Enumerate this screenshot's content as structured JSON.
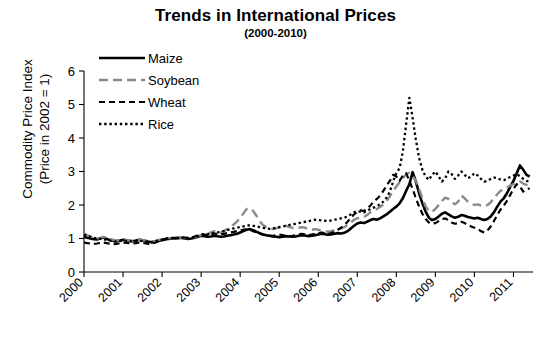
{
  "chart_data": {
    "type": "line",
    "title": "Trends in International Prices",
    "subtitle": "(2000-2010)",
    "xlabel": "",
    "ylabel_line1": "Commodity Price Index",
    "ylabel_line2": "(Price in 2002 = 1)",
    "ylim": [
      0,
      6
    ],
    "yticks": [
      0,
      1,
      2,
      3,
      4,
      5,
      6
    ],
    "xlim": [
      2000,
      2011.5
    ],
    "xticks": [
      2000,
      2001,
      2002,
      2003,
      2004,
      2005,
      2006,
      2007,
      2008,
      2009,
      2010,
      2011
    ],
    "xtick_labels": [
      "2000",
      "2001",
      "2002",
      "2003",
      "2004",
      "2005",
      "2006",
      "2007",
      "2008",
      "2009",
      "2010",
      "2011"
    ],
    "xtick_rotation_deg": -45,
    "grid": false,
    "legend_position": "top-left-inside",
    "x_start": 2000.0,
    "x_step": 0.0833333,
    "series": [
      {
        "name": "Maize",
        "color": "#000000",
        "style": "solid",
        "width": 2.6,
        "values": [
          1.05,
          1.02,
          1.0,
          0.98,
          0.97,
          1.0,
          1.03,
          0.99,
          0.95,
          0.93,
          0.92,
          0.94,
          0.96,
          0.95,
          0.93,
          0.92,
          0.94,
          0.96,
          0.95,
          0.92,
          0.9,
          0.88,
          0.9,
          0.93,
          0.95,
          0.97,
          0.99,
          1.0,
          1.0,
          1.01,
          1.02,
          1.0,
          0.99,
          1.0,
          1.02,
          1.05,
          1.08,
          1.07,
          1.05,
          1.06,
          1.08,
          1.07,
          1.05,
          1.06,
          1.08,
          1.1,
          1.12,
          1.14,
          1.18,
          1.22,
          1.26,
          1.28,
          1.25,
          1.2,
          1.16,
          1.12,
          1.1,
          1.08,
          1.06,
          1.05,
          1.04,
          1.05,
          1.07,
          1.06,
          1.05,
          1.06,
          1.08,
          1.1,
          1.09,
          1.07,
          1.08,
          1.1,
          1.12,
          1.14,
          1.13,
          1.11,
          1.12,
          1.14,
          1.16,
          1.15,
          1.17,
          1.22,
          1.3,
          1.38,
          1.45,
          1.48,
          1.46,
          1.5,
          1.55,
          1.58,
          1.56,
          1.6,
          1.66,
          1.72,
          1.8,
          1.88,
          1.95,
          2.05,
          2.2,
          2.42,
          2.62,
          2.98,
          2.7,
          2.35,
          2.05,
          1.8,
          1.62,
          1.55,
          1.58,
          1.66,
          1.74,
          1.78,
          1.72,
          1.66,
          1.62,
          1.65,
          1.7,
          1.68,
          1.64,
          1.62,
          1.6,
          1.62,
          1.58,
          1.55,
          1.58,
          1.66,
          1.78,
          1.95,
          2.1,
          2.2,
          2.35,
          2.55,
          2.72,
          2.95,
          3.18,
          3.05,
          2.9,
          2.85
        ]
      },
      {
        "name": "Soybean",
        "color": "#8a8a8a",
        "style": "dash-long",
        "width": 2.4,
        "values": [
          1.14,
          1.1,
          1.06,
          1.02,
          1.0,
          1.02,
          1.05,
          1.03,
          0.99,
          0.96,
          0.94,
          0.95,
          0.97,
          0.96,
          0.94,
          0.93,
          0.95,
          0.97,
          0.96,
          0.94,
          0.92,
          0.91,
          0.93,
          0.96,
          0.98,
          1.0,
          1.01,
          1.02,
          1.01,
          1.02,
          1.03,
          1.02,
          1.01,
          1.02,
          1.04,
          1.07,
          1.1,
          1.12,
          1.14,
          1.18,
          1.22,
          1.2,
          1.18,
          1.22,
          1.28,
          1.35,
          1.42,
          1.5,
          1.62,
          1.75,
          1.88,
          1.9,
          1.82,
          1.68,
          1.52,
          1.4,
          1.34,
          1.3,
          1.28,
          1.3,
          1.33,
          1.36,
          1.38,
          1.35,
          1.32,
          1.3,
          1.32,
          1.34,
          1.32,
          1.28,
          1.26,
          1.28,
          1.26,
          1.24,
          1.22,
          1.2,
          1.22,
          1.25,
          1.28,
          1.3,
          1.34,
          1.4,
          1.48,
          1.56,
          1.6,
          1.62,
          1.64,
          1.7,
          1.78,
          1.84,
          1.88,
          1.94,
          2.02,
          2.12,
          2.26,
          2.42,
          2.55,
          2.68,
          2.8,
          2.92,
          2.96,
          2.88,
          2.72,
          2.48,
          2.2,
          1.96,
          1.82,
          1.8,
          1.88,
          2.0,
          2.12,
          2.22,
          2.18,
          2.08,
          2.02,
          2.1,
          2.28,
          2.2,
          2.1,
          2.04,
          2.0,
          2.02,
          1.98,
          1.96,
          2.0,
          2.08,
          2.2,
          2.32,
          2.42,
          2.48,
          2.52,
          2.58,
          2.62,
          2.66,
          2.7,
          2.64,
          2.6,
          2.58
        ]
      },
      {
        "name": "Wheat",
        "color": "#000000",
        "style": "dash",
        "width": 2.2,
        "values": [
          0.88,
          0.86,
          0.85,
          0.84,
          0.85,
          0.87,
          0.88,
          0.86,
          0.84,
          0.83,
          0.84,
          0.86,
          0.88,
          0.87,
          0.86,
          0.85,
          0.86,
          0.88,
          0.87,
          0.85,
          0.84,
          0.85,
          0.88,
          0.92,
          0.96,
          0.99,
          1.01,
          1.02,
          1.02,
          1.03,
          1.04,
          1.03,
          1.02,
          1.03,
          1.06,
          1.1,
          1.14,
          1.12,
          1.1,
          1.12,
          1.15,
          1.14,
          1.12,
          1.14,
          1.16,
          1.18,
          1.2,
          1.22,
          1.24,
          1.26,
          1.28,
          1.26,
          1.22,
          1.18,
          1.14,
          1.12,
          1.1,
          1.09,
          1.08,
          1.1,
          1.12,
          1.1,
          1.08,
          1.07,
          1.08,
          1.1,
          1.12,
          1.14,
          1.12,
          1.1,
          1.12,
          1.14,
          1.16,
          1.18,
          1.16,
          1.14,
          1.16,
          1.2,
          1.26,
          1.32,
          1.4,
          1.5,
          1.62,
          1.72,
          1.8,
          1.84,
          1.82,
          1.88,
          1.98,
          2.1,
          2.18,
          2.28,
          2.42,
          2.58,
          2.72,
          2.9,
          2.85,
          2.72,
          2.88,
          2.95,
          2.72,
          2.48,
          2.2,
          1.95,
          1.74,
          1.58,
          1.48,
          1.44,
          1.46,
          1.52,
          1.58,
          1.6,
          1.55,
          1.48,
          1.44,
          1.46,
          1.5,
          1.46,
          1.4,
          1.36,
          1.32,
          1.28,
          1.22,
          1.18,
          1.24,
          1.36,
          1.52,
          1.7,
          1.86,
          1.98,
          2.12,
          2.3,
          2.48,
          2.62,
          2.55,
          2.4,
          2.46,
          2.5
        ]
      },
      {
        "name": "Rice",
        "color": "#000000",
        "style": "dot",
        "width": 2.3,
        "values": [
          1.12,
          1.08,
          1.05,
          1.02,
          1.0,
          0.99,
          0.98,
          0.96,
          0.94,
          0.92,
          0.91,
          0.92,
          0.94,
          0.93,
          0.92,
          0.91,
          0.92,
          0.93,
          0.92,
          0.91,
          0.9,
          0.9,
          0.92,
          0.95,
          0.97,
          0.99,
          1.0,
          1.01,
          1.01,
          1.02,
          1.02,
          1.01,
          1.01,
          1.02,
          1.04,
          1.06,
          1.08,
          1.1,
          1.12,
          1.14,
          1.16,
          1.18,
          1.2,
          1.22,
          1.25,
          1.28,
          1.3,
          1.32,
          1.34,
          1.36,
          1.38,
          1.4,
          1.38,
          1.36,
          1.34,
          1.32,
          1.3,
          1.29,
          1.3,
          1.32,
          1.34,
          1.36,
          1.38,
          1.4,
          1.42,
          1.44,
          1.46,
          1.48,
          1.5,
          1.52,
          1.54,
          1.56,
          1.55,
          1.54,
          1.53,
          1.52,
          1.54,
          1.56,
          1.58,
          1.6,
          1.62,
          1.66,
          1.72,
          1.78,
          1.82,
          1.8,
          1.78,
          1.82,
          1.88,
          1.92,
          1.96,
          2.02,
          2.1,
          2.22,
          2.4,
          2.7,
          2.95,
          3.1,
          3.6,
          4.4,
          5.2,
          4.6,
          3.95,
          3.4,
          3.05,
          2.85,
          2.75,
          2.9,
          3.0,
          2.85,
          2.7,
          2.8,
          3.0,
          2.92,
          2.78,
          2.88,
          3.0,
          2.9,
          2.8,
          2.85,
          2.95,
          2.88,
          2.78,
          2.7,
          2.72,
          2.78,
          2.82,
          2.8,
          2.76,
          2.74,
          2.78,
          2.84,
          2.88,
          2.92,
          2.86,
          2.78,
          2.72,
          2.7
        ]
      }
    ]
  },
  "legend": {
    "items": [
      {
        "label": "Maize"
      },
      {
        "label": "Soybean"
      },
      {
        "label": "Wheat"
      },
      {
        "label": "Rice"
      }
    ]
  }
}
